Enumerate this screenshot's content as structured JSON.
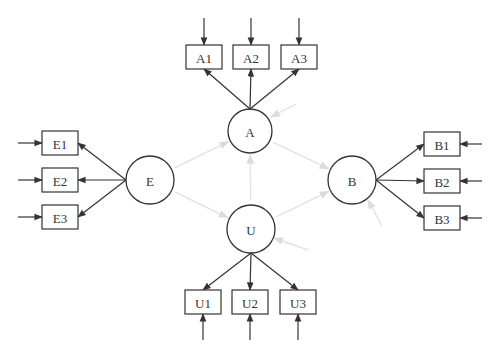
{
  "diagram": {
    "type": "structural-equation-model",
    "latent_variables": [
      {
        "id": "A",
        "label": "A",
        "cx": 250,
        "cy": 131,
        "r": 22
      },
      {
        "id": "E",
        "label": "E",
        "cx": 150,
        "cy": 180,
        "r": 24
      },
      {
        "id": "B",
        "label": "B",
        "cx": 352,
        "cy": 180,
        "r": 24
      },
      {
        "id": "U",
        "label": "U",
        "cx": 251,
        "cy": 229,
        "r": 24
      }
    ],
    "indicators": [
      {
        "id": "A1",
        "label": "A1",
        "x": 186,
        "y": 45,
        "w": 36,
        "h": 24,
        "latent": "A",
        "error_dir": "top"
      },
      {
        "id": "A2",
        "label": "A2",
        "x": 233,
        "y": 45,
        "w": 36,
        "h": 24,
        "latent": "A",
        "error_dir": "top"
      },
      {
        "id": "A3",
        "label": "A3",
        "x": 281,
        "y": 45,
        "w": 36,
        "h": 24,
        "latent": "A",
        "error_dir": "top"
      },
      {
        "id": "E1",
        "label": "E1",
        "x": 42,
        "y": 131,
        "w": 36,
        "h": 24,
        "latent": "E",
        "error_dir": "left"
      },
      {
        "id": "E2",
        "label": "E2",
        "x": 42,
        "y": 168,
        "w": 36,
        "h": 24,
        "latent": "E",
        "error_dir": "left"
      },
      {
        "id": "E3",
        "label": "E3",
        "x": 42,
        "y": 205,
        "w": 36,
        "h": 24,
        "latent": "E",
        "error_dir": "left"
      },
      {
        "id": "B1",
        "label": "B1",
        "x": 424,
        "y": 132,
        "w": 36,
        "h": 24,
        "latent": "B",
        "error_dir": "right"
      },
      {
        "id": "B2",
        "label": "B2",
        "x": 424,
        "y": 169,
        "w": 36,
        "h": 24,
        "latent": "B",
        "error_dir": "right"
      },
      {
        "id": "B3",
        "label": "B3",
        "x": 424,
        "y": 206,
        "w": 36,
        "h": 24,
        "latent": "B",
        "error_dir": "right"
      },
      {
        "id": "U1",
        "label": "U1",
        "x": 185,
        "y": 290,
        "w": 36,
        "h": 24,
        "latent": "U",
        "error_dir": "bottom"
      },
      {
        "id": "U2",
        "label": "U2",
        "x": 232,
        "y": 290,
        "w": 36,
        "h": 24,
        "latent": "U",
        "error_dir": "bottom"
      },
      {
        "id": "U3",
        "label": "U3",
        "x": 280,
        "y": 290,
        "w": 36,
        "h": 24,
        "latent": "U",
        "error_dir": "bottom"
      }
    ],
    "structural_paths": [
      {
        "from": "E",
        "to": "A"
      },
      {
        "from": "A",
        "to": "B"
      },
      {
        "from": "E",
        "to": "U"
      },
      {
        "from": "U",
        "to": "B"
      },
      {
        "from": "U",
        "to": "A"
      }
    ],
    "disturbance_arrows": [
      "A",
      "B",
      "U"
    ],
    "colors": {
      "stroke": "#333333",
      "structural": "#e2e2e2",
      "background": "#ffffff"
    }
  }
}
